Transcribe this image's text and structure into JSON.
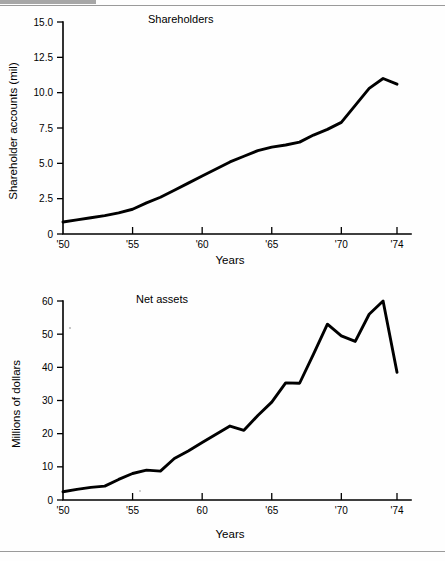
{
  "page": {
    "background": "#fefefe",
    "ink": "#000000",
    "rule_color": "#9a9a9a"
  },
  "charts": [
    {
      "id": "shareholders",
      "chart_data": {
        "type": "line",
        "title": "Shareholders",
        "xlabel": "Years",
        "ylabel": "Shareholder accounts (mil)",
        "xlim": [
          1950,
          1974
        ],
        "ylim": [
          0,
          15
        ],
        "xtick_values": [
          1950,
          1955,
          1960,
          1965,
          1970,
          1974
        ],
        "xtick_labels": [
          "'50",
          "'55",
          "'60",
          "'65",
          "'70",
          "'74"
        ],
        "ytick_values": [
          0,
          2.5,
          5.0,
          7.5,
          10.0,
          12.5,
          15.0
        ],
        "ytick_labels": [
          "0",
          "2.5",
          "5.0",
          "7.5",
          "10.0",
          "12.5",
          "15.0"
        ],
        "grid": false,
        "legend": "none",
        "series": [
          {
            "name": "Shareholder accounts",
            "x": [
              1950,
              1951,
              1952,
              1953,
              1954,
              1955,
              1956,
              1957,
              1958,
              1959,
              1960,
              1961,
              1962,
              1963,
              1964,
              1965,
              1966,
              1967,
              1968,
              1969,
              1970,
              1971,
              1972,
              1973,
              1974
            ],
            "values": [
              0.85,
              1.0,
              1.15,
              1.3,
              1.5,
              1.75,
              2.2,
              2.6,
              3.1,
              3.6,
              4.1,
              4.6,
              5.1,
              5.5,
              5.9,
              6.15,
              6.3,
              6.5,
              7.0,
              7.4,
              7.9,
              9.1,
              10.3,
              11.0,
              10.6
            ]
          }
        ]
      }
    },
    {
      "id": "net-assets",
      "chart_data": {
        "type": "line",
        "title": "Net assets",
        "xlabel": "Years",
        "ylabel": "Millions of dollars",
        "xlim": [
          1950,
          1974
        ],
        "ylim": [
          0,
          60
        ],
        "xtick_values": [
          1950,
          1955,
          1960,
          1965,
          1970,
          1974
        ],
        "xtick_labels": [
          "'50",
          "'55",
          "60",
          "'65",
          "'70",
          "'74"
        ],
        "ytick_values": [
          0,
          10,
          20,
          30,
          40,
          50,
          60
        ],
        "ytick_labels": [
          "0",
          "10",
          "20",
          "30",
          "40",
          "50",
          "60"
        ],
        "grid": false,
        "legend": "none",
        "series": [
          {
            "name": "Net assets",
            "x": [
              1950,
              1951,
              1952,
              1953,
              1954,
              1955,
              1956,
              1957,
              1958,
              1959,
              1960,
              1961,
              1962,
              1963,
              1964,
              1965,
              1966,
              1967,
              1968,
              1969,
              1970,
              1971,
              1972,
              1973,
              1974
            ],
            "values": [
              2.5,
              3.2,
              3.8,
              4.2,
              6.2,
              8.0,
              9.0,
              8.7,
              12.5,
              14.8,
              17.3,
              19.8,
              22.3,
              21.0,
              25.5,
              29.5,
              35.3,
              35.2,
              44.0,
              53.0,
              49.5,
              47.8,
              56.0,
              60.0,
              38.5
            ]
          }
        ]
      }
    }
  ]
}
